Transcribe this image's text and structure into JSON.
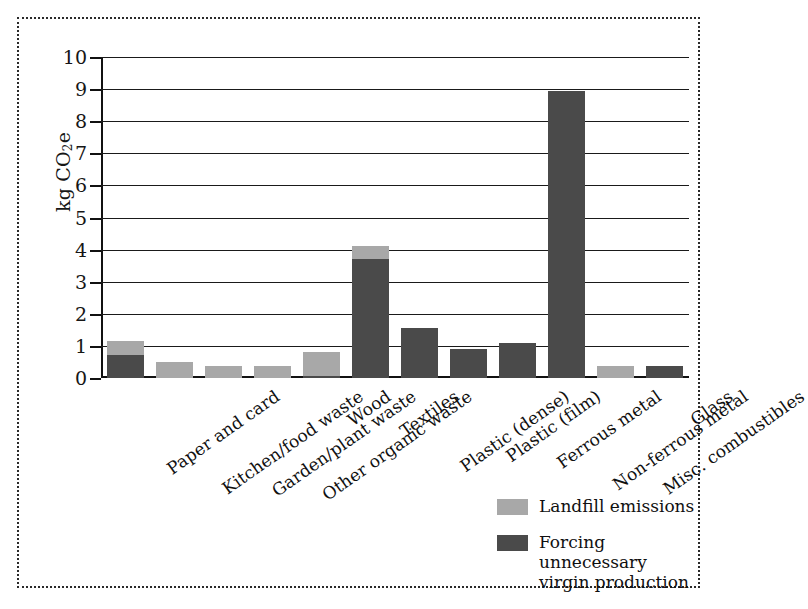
{
  "chart_data": {
    "type": "bar",
    "stacked": true,
    "title": "",
    "xlabel": "",
    "ylabel": "kg CO2e",
    "ylim": [
      0,
      10
    ],
    "yticks": [
      0,
      1,
      2,
      3,
      4,
      5,
      6,
      7,
      8,
      9,
      10
    ],
    "grid": true,
    "legend_position": "bottom-right",
    "categories": [
      "Paper and card",
      "Kitchen/food waste",
      "Garden/plant waste",
      "Other organic waste",
      "Wood",
      "Textiles",
      "Plastic (dense)",
      "Plastic (film)",
      "Ferrous metal",
      "Non-ferrous metal",
      "Misc. combustibles",
      "Glass"
    ],
    "series": [
      {
        "name": "Forcing unnecessary virgin production",
        "color": "#4a4a4a",
        "values": [
          0.72,
          0,
          0,
          0,
          0.06,
          3.72,
          1.55,
          0.9,
          1.1,
          8.95,
          0,
          0.38
        ]
      },
      {
        "name": "Landfill emissions",
        "color": "#a8a8a8",
        "values": [
          0.43,
          0.5,
          0.37,
          0.37,
          0.76,
          0.38,
          0,
          0,
          0,
          0,
          0.38,
          0
        ]
      }
    ],
    "totals": [
      1.15,
      0.5,
      0.37,
      0.37,
      0.82,
      4.1,
      1.55,
      0.9,
      1.1,
      8.95,
      0.38,
      0.38
    ]
  },
  "legend": {
    "items": [
      {
        "label": "Landfill emissions",
        "color": "#a8a8a8"
      },
      {
        "label": "Forcing unnecessary virgin production",
        "color": "#4a4a4a"
      }
    ]
  },
  "axis": {
    "y_label_main": "kg CO",
    "y_label_sub": "2",
    "y_label_tail": "e",
    "tick_0": "0",
    "tick_1": "1",
    "tick_2": "2",
    "tick_3": "3",
    "tick_4": "4",
    "tick_5": "5",
    "tick_6": "6",
    "tick_7": "7",
    "tick_8": "8",
    "tick_9": "9",
    "tick_10": "10"
  }
}
